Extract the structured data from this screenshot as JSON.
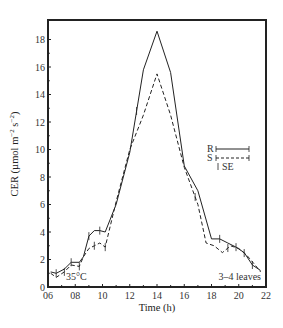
{
  "chart_data": {
    "type": "line",
    "title": "",
    "xlabel": "Time (h)",
    "ylabel": "CER (µmol m⁻² s⁻²)",
    "ylabel_parts": {
      "main": "CER (µmol m",
      "sup1": "−2",
      "mid": " s",
      "sup2": "−2",
      "end": ")"
    },
    "xlim": [
      6,
      22
    ],
    "ylim": [
      0,
      19
    ],
    "xticks": [
      6,
      8,
      10,
      12,
      14,
      16,
      18,
      20,
      22
    ],
    "xtick_labels": [
      "06",
      "08",
      "10",
      "12",
      "14",
      "16",
      "18",
      "20",
      "22"
    ],
    "yticks": [
      0,
      2,
      4,
      6,
      8,
      10,
      12,
      14,
      16,
      18
    ],
    "ytick_labels": [
      "0",
      "2",
      "4",
      "6",
      "8",
      "10",
      "12",
      "14",
      "16",
      "18"
    ],
    "grid": false,
    "legend_position": "right-middle",
    "legend": [
      {
        "label": "R",
        "style": "solid"
      },
      {
        "label": "S",
        "style": "dashed"
      },
      {
        "label": "SE",
        "style": "errorbar"
      }
    ],
    "annotations": [
      {
        "text": "35°C",
        "position": "bottom-left"
      },
      {
        "text": "3–4 leaves",
        "position": "bottom-right"
      }
    ],
    "series": [
      {
        "name": "R",
        "style": "solid",
        "x": [
          6.2,
          6.6,
          7.2,
          7.7,
          8.3,
          8.6,
          9.0,
          9.4,
          9.8,
          10.2,
          11,
          12,
          13,
          14,
          15,
          16,
          17,
          18,
          18.6,
          19.2,
          19.8,
          20.4,
          21,
          21.6
        ],
        "values": [
          1.1,
          1.0,
          1.3,
          1.8,
          1.8,
          2.2,
          3.7,
          4.1,
          4.1,
          4.0,
          6.0,
          9.8,
          15.8,
          18.6,
          15.6,
          8.8,
          7.0,
          3.5,
          3.5,
          3.2,
          2.9,
          2.5,
          1.6,
          1.2
        ]
      },
      {
        "name": "S",
        "style": "dashed",
        "x": [
          6.2,
          6.6,
          7.2,
          7.7,
          8.3,
          8.6,
          9.0,
          9.4,
          9.8,
          10.2,
          11,
          12,
          13,
          14,
          15,
          16,
          17,
          17.6,
          18.2,
          18.8,
          19.4,
          20,
          20.6,
          21.2,
          21.6
        ],
        "values": [
          1.0,
          0.7,
          1.1,
          1.6,
          1.5,
          2.2,
          2.8,
          3.0,
          3.2,
          2.9,
          6.2,
          10.0,
          12.5,
          15.5,
          12.5,
          8.7,
          6.0,
          3.2,
          3.0,
          2.5,
          3.0,
          2.8,
          2.3,
          1.6,
          1.1
        ]
      }
    ],
    "error_bars_at": [
      6.6,
      7.2,
      7.7,
      8.3,
      9.0,
      9.4,
      9.8,
      10.2,
      12.5,
      16.8,
      18.6,
      19.2,
      19.8,
      20.4,
      21.0
    ]
  }
}
